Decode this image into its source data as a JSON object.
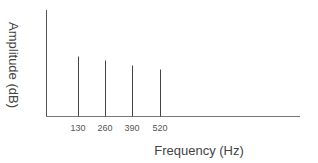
{
  "chart_data": {
    "type": "bar",
    "subtype": "stem / line spectrum",
    "title": "",
    "xlabel": "Frequency (Hz)",
    "ylabel": "Amplitude (dB)",
    "categories": [
      "130",
      "260",
      "390",
      "520"
    ],
    "x": [
      130,
      260,
      390,
      520
    ],
    "values": [
      60,
      56,
      51,
      47
    ],
    "values_note": "relative heights in pixels above baseline (no y tick scale shown)",
    "grid": false,
    "legend": null,
    "colors": {
      "axis": "#555555",
      "stem": "#444444",
      "text": "#444444"
    }
  },
  "axes": {
    "x_label": "Frequency (Hz)",
    "y_label": "Amplitude (dB)",
    "x_ticks": [
      "130",
      "260",
      "390",
      "520"
    ]
  }
}
